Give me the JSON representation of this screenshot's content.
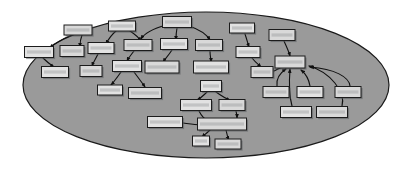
{
  "figure": {
    "kind": "node-link-diagram",
    "title": "",
    "boundary": {
      "shape": "ellipse",
      "name": "system-boundary-ellipse",
      "cx": 206,
      "cy": 85,
      "rx": 183,
      "ry": 73,
      "fill": "#9a9a9a",
      "stroke": "#1a1a1a"
    },
    "canvas": {
      "width": 412,
      "height": 170,
      "background": "#ffffff"
    },
    "style": {
      "node_fill": "#d9d9d9",
      "node_fill_alt": "#e2e2e2",
      "node_stroke": "#1c1c1c",
      "edge_stroke": "#101010",
      "shadow": "#555a5c",
      "label_color": "#8f9193"
    }
  },
  "chart_data": {
    "type": "diagram",
    "title": "",
    "xlabel": "",
    "ylabel": "",
    "legend": [],
    "node_count": 41,
    "edge_count": 38,
    "nodes": [
      {
        "id": "n01",
        "label": "",
        "x": 78,
        "y": 30,
        "w": 28,
        "h": 10
      },
      {
        "id": "n02",
        "label": "",
        "x": 122,
        "y": 26,
        "w": 27,
        "h": 10
      },
      {
        "id": "n03",
        "label": "",
        "x": 177,
        "y": 22,
        "w": 29,
        "h": 11
      },
      {
        "id": "n04",
        "label": "",
        "x": 242,
        "y": 28,
        "w": 25,
        "h": 10
      },
      {
        "id": "n05",
        "label": "",
        "x": 282,
        "y": 35,
        "w": 26,
        "h": 11
      },
      {
        "id": "n06",
        "label": "",
        "x": 39,
        "y": 52,
        "w": 29,
        "h": 11
      },
      {
        "id": "n07",
        "label": "",
        "x": 72,
        "y": 51,
        "w": 24,
        "h": 11
      },
      {
        "id": "n08",
        "label": "",
        "x": 101,
        "y": 48,
        "w": 26,
        "h": 11
      },
      {
        "id": "n09",
        "label": "",
        "x": 138,
        "y": 45,
        "w": 28,
        "h": 11
      },
      {
        "id": "n10",
        "label": "",
        "x": 174,
        "y": 44,
        "w": 27,
        "h": 11
      },
      {
        "id": "n11",
        "label": "",
        "x": 209,
        "y": 45,
        "w": 27,
        "h": 11
      },
      {
        "id": "n12",
        "label": "",
        "x": 248,
        "y": 52,
        "w": 24,
        "h": 11
      },
      {
        "id": "n13",
        "label": "",
        "x": 290,
        "y": 62,
        "w": 30,
        "h": 12
      },
      {
        "id": "n14",
        "label": "",
        "x": 55,
        "y": 72,
        "w": 27,
        "h": 11
      },
      {
        "id": "n15",
        "label": "",
        "x": 91,
        "y": 71,
        "w": 22,
        "h": 11
      },
      {
        "id": "n16",
        "label": "",
        "x": 127,
        "y": 66,
        "w": 29,
        "h": 11
      },
      {
        "id": "n17",
        "label": "",
        "x": 162,
        "y": 67,
        "w": 34,
        "h": 12
      },
      {
        "id": "n18",
        "label": "",
        "x": 211,
        "y": 67,
        "w": 35,
        "h": 12
      },
      {
        "id": "n19",
        "label": "",
        "x": 262,
        "y": 72,
        "w": 22,
        "h": 11
      },
      {
        "id": "n20",
        "label": "",
        "x": 110,
        "y": 90,
        "w": 25,
        "h": 10
      },
      {
        "id": "n21",
        "label": "",
        "x": 145,
        "y": 93,
        "w": 33,
        "h": 11
      },
      {
        "id": "n22",
        "label": "",
        "x": 211,
        "y": 86,
        "w": 21,
        "h": 11
      },
      {
        "id": "n23",
        "label": "",
        "x": 276,
        "y": 92,
        "w": 26,
        "h": 11
      },
      {
        "id": "n24",
        "label": "",
        "x": 310,
        "y": 92,
        "w": 26,
        "h": 11
      },
      {
        "id": "n25",
        "label": "",
        "x": 348,
        "y": 92,
        "w": 26,
        "h": 11
      },
      {
        "id": "n26",
        "label": "",
        "x": 196,
        "y": 105,
        "w": 31,
        "h": 11
      },
      {
        "id": "n27",
        "label": "",
        "x": 232,
        "y": 105,
        "w": 26,
        "h": 11
      },
      {
        "id": "n28",
        "label": "",
        "x": 296,
        "y": 112,
        "w": 31,
        "h": 11
      },
      {
        "id": "n29",
        "label": "",
        "x": 332,
        "y": 112,
        "w": 31,
        "h": 11
      },
      {
        "id": "n30",
        "label": "",
        "x": 165,
        "y": 122,
        "w": 35,
        "h": 11
      },
      {
        "id": "n31",
        "label": "",
        "x": 222,
        "y": 124,
        "w": 49,
        "h": 12
      },
      {
        "id": "n32",
        "label": "",
        "x": 201,
        "y": 141,
        "w": 17,
        "h": 10
      },
      {
        "id": "n33",
        "label": "",
        "x": 228,
        "y": 144,
        "w": 26,
        "h": 10
      }
    ],
    "edges": [
      {
        "from": "n01",
        "to": "n06"
      },
      {
        "from": "n01",
        "to": "n07"
      },
      {
        "from": "n02",
        "to": "n08"
      },
      {
        "from": "n02",
        "to": "n09"
      },
      {
        "from": "n03",
        "to": "n10"
      },
      {
        "from": "n03",
        "to": "n09"
      },
      {
        "from": "n03",
        "to": "n11"
      },
      {
        "from": "n04",
        "to": "n12"
      },
      {
        "from": "n05",
        "to": "n13"
      },
      {
        "from": "n06",
        "to": "n14"
      },
      {
        "from": "n08",
        "to": "n15"
      },
      {
        "from": "n09",
        "to": "n16"
      },
      {
        "from": "n10",
        "to": "n17"
      },
      {
        "from": "n11",
        "to": "n18"
      },
      {
        "from": "n12",
        "to": "n19"
      },
      {
        "from": "n19",
        "to": "n13"
      },
      {
        "from": "n16",
        "to": "n20"
      },
      {
        "from": "n16",
        "to": "n21"
      },
      {
        "from": "n22",
        "to": "n26"
      },
      {
        "from": "n22",
        "to": "n27"
      },
      {
        "from": "n23",
        "to": "n13"
      },
      {
        "from": "n24",
        "to": "n13"
      },
      {
        "from": "n25",
        "to": "n13"
      },
      {
        "from": "n28",
        "to": "n13"
      },
      {
        "from": "n29",
        "to": "n13"
      },
      {
        "from": "n26",
        "to": "n31"
      },
      {
        "from": "n27",
        "to": "n31"
      },
      {
        "from": "n30",
        "to": "n31"
      },
      {
        "from": "n31",
        "to": "n32"
      },
      {
        "from": "n31",
        "to": "n33"
      }
    ]
  }
}
